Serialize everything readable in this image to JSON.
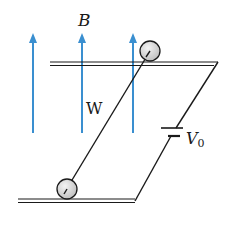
{
  "labels": {
    "field": "B",
    "wire": "W",
    "voltage_main": "V",
    "voltage_sub": "0"
  },
  "colors": {
    "field_arrows": "#3a8fd0",
    "lines": "#1a1a1a",
    "wheel_fill": "#d8d8d8"
  },
  "elements": {
    "field_arrow_count": 3,
    "rails": 2,
    "wheels": 2,
    "battery": "V0"
  }
}
